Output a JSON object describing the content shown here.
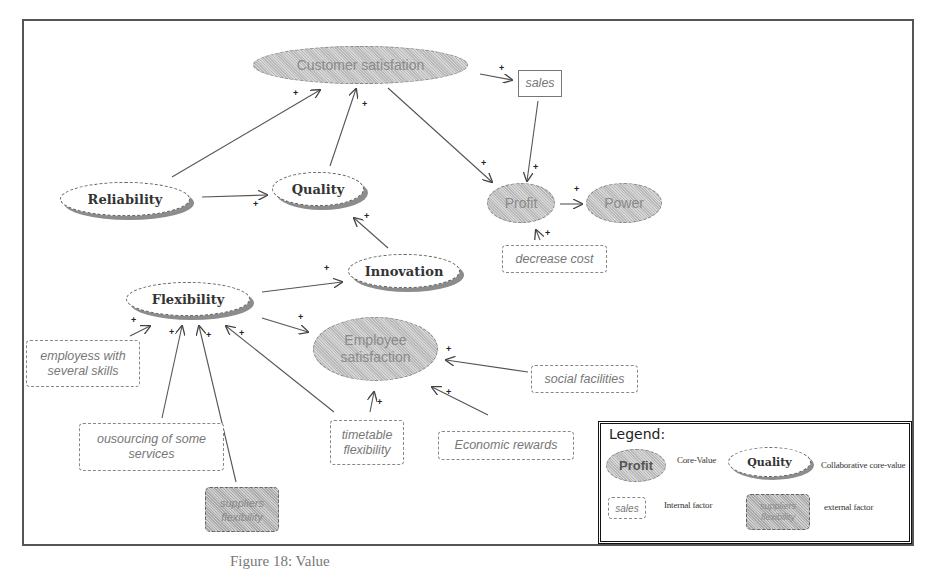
{
  "diagram": {
    "nodes": {
      "customer_satisfaction": {
        "label": "Customer satisfation",
        "type": "core-value"
      },
      "sales": {
        "label": "sales",
        "type": "internal-factor"
      },
      "profit": {
        "label": "Profit",
        "type": "core-value"
      },
      "power": {
        "label": "Power",
        "type": "core-value"
      },
      "decrease_cost": {
        "label": "decrease cost",
        "type": "internal-factor"
      },
      "reliability": {
        "label": "Reliability",
        "type": "collaborative-core-value"
      },
      "quality": {
        "label": "Quality",
        "type": "collaborative-core-value"
      },
      "innovation": {
        "label": "Innovation",
        "type": "collaborative-core-value"
      },
      "flexibility": {
        "label": "Flexibility",
        "type": "collaborative-core-value"
      },
      "employee_satisfaction": {
        "label_line1": "Employee",
        "label_line2": "satisfaction",
        "type": "core-value"
      },
      "employees_skills": {
        "label_line1": "employess with",
        "label_line2": "several skills",
        "type": "internal-factor"
      },
      "outsourcing": {
        "label_line1": "ousourcing of some",
        "label_line2": "services",
        "type": "internal-factor"
      },
      "suppliers_flexibility": {
        "label_line1": "suppliers",
        "label_line2": "flexibility",
        "type": "external-factor"
      },
      "timetable_flexibility": {
        "label_line1": "timetable",
        "label_line2": "flexibility",
        "type": "internal-factor"
      },
      "economic_rewards": {
        "label": "Economic rewards",
        "type": "internal-factor"
      },
      "social_facilities": {
        "label": "social facilities",
        "type": "internal-factor"
      }
    },
    "edges": [
      {
        "from": "Reliability",
        "to": "Customer satisfation",
        "sign": "+"
      },
      {
        "from": "Quality",
        "to": "Customer satisfation",
        "sign": "+"
      },
      {
        "from": "Customer satisfation",
        "to": "sales",
        "sign": "+"
      },
      {
        "from": "Customer satisfation",
        "to": "Profit",
        "sign": "+"
      },
      {
        "from": "sales",
        "to": "Profit",
        "sign": "+"
      },
      {
        "from": "Profit",
        "to": "Power",
        "sign": "+"
      },
      {
        "from": "decrease cost",
        "to": "Profit",
        "sign": "+"
      },
      {
        "from": "Reliability",
        "to": "Quality",
        "sign": "+"
      },
      {
        "from": "Innovation",
        "to": "Quality",
        "sign": "+"
      },
      {
        "from": "Flexibility",
        "to": "Innovation",
        "sign": "+"
      },
      {
        "from": "Flexibility",
        "to": "Employee satisfaction",
        "sign": "+"
      },
      {
        "from": "employess with several skills",
        "to": "Flexibility",
        "sign": "+"
      },
      {
        "from": "ousourcing of some services",
        "to": "Flexibility",
        "sign": "+"
      },
      {
        "from": "suppliers flexibility",
        "to": "Flexibility",
        "sign": "+"
      },
      {
        "from": "timetable flexibility",
        "to": "Flexibility",
        "sign": "+"
      },
      {
        "from": "timetable flexibility",
        "to": "Employee satisfaction",
        "sign": "+"
      },
      {
        "from": "Economic rewards",
        "to": "Employee satisfaction",
        "sign": "+"
      },
      {
        "from": "social facilities",
        "to": "Employee satisfaction",
        "sign": "+"
      }
    ],
    "sign_symbol": "+"
  },
  "legend": {
    "title": "Legend:",
    "items": [
      {
        "sample": "Profit",
        "description": "Core-Value"
      },
      {
        "sample": "Quality",
        "description": "Collaborative core-value"
      },
      {
        "sample": "sales",
        "description": "Internal factor"
      },
      {
        "sample_line1": "suppliers",
        "sample_line2": "flexibility",
        "description": "external factor"
      }
    ]
  },
  "caption": "Figure 18: Value"
}
